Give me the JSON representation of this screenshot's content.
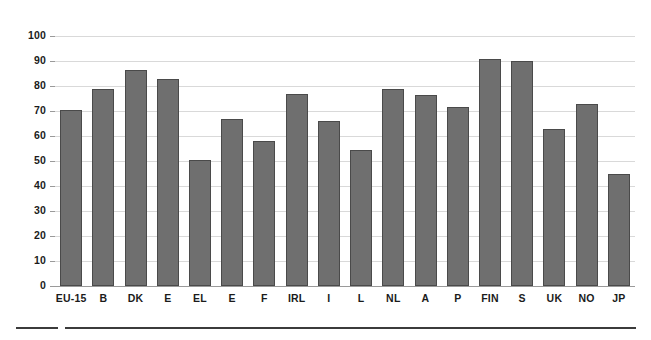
{
  "chart_data": {
    "type": "bar",
    "title": "",
    "subtitle": "",
    "xlabel": "",
    "ylabel": "",
    "categories": [
      "EU-15",
      "B",
      "DK",
      "E",
      "EL",
      "E",
      "F",
      "IRL",
      "I",
      "L",
      "NL",
      "A",
      "P",
      "FIN",
      "S",
      "UK",
      "NO",
      "JP"
    ],
    "values": [
      70.5,
      79,
      86.5,
      83,
      50.5,
      67,
      58,
      77,
      66,
      54.5,
      79,
      76.5,
      71.5,
      91,
      90,
      63,
      73,
      45
    ],
    "series": [
      {
        "name": "",
        "values": [
          70.5,
          79,
          86.5,
          83,
          50.5,
          67,
          58,
          77,
          66,
          54.5,
          79,
          76.5,
          71.5,
          91,
          90,
          63,
          73,
          45
        ]
      }
    ],
    "ylim": [
      0,
      100
    ],
    "ytick_labels": [
      "100",
      "90",
      "80",
      "70",
      "60",
      "50",
      "40",
      "30",
      "20",
      "10",
      "0"
    ],
    "ytick_values": [
      100,
      90,
      80,
      70,
      60,
      50,
      40,
      30,
      20,
      10,
      0
    ],
    "grid": true,
    "grid_axis": "y",
    "legend": false,
    "legend_position": "none",
    "annotations": [],
    "colors": {
      "bar_fill": "#6f6f6f",
      "bar_edge": "#4a4a4a",
      "gridline": "#d9d9d9",
      "baseline": "#9a9a9a",
      "text": "#1b1b1b",
      "rule": "#3b3b3b",
      "background": "#ffffff"
    }
  },
  "footer": {
    "rule_short": "",
    "rule_long": ""
  }
}
